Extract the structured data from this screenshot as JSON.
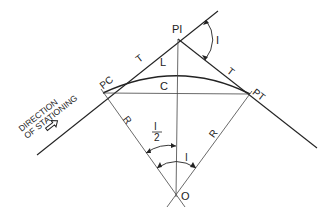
{
  "diagram": {
    "colors": {
      "line": "#222222",
      "background": "#ffffff"
    },
    "points": {
      "pc": {
        "label": "PC"
      },
      "pi": {
        "label": "PI"
      },
      "pt": {
        "label": "PT"
      },
      "o": {
        "label": "O"
      }
    },
    "labels": {
      "tangent_left": "T",
      "tangent_right": "T",
      "arc_length": "L",
      "chord": "C",
      "radius_left": "R",
      "radius_right": "R",
      "deflection_angle": "I",
      "central_angle": "I",
      "half_angle_num": "I",
      "half_angle_den": "2"
    },
    "direction": {
      "line1": "DIRECTION",
      "line2": "OF STATIONING",
      "arrow_icon": "hollow-arrow-icon"
    }
  }
}
